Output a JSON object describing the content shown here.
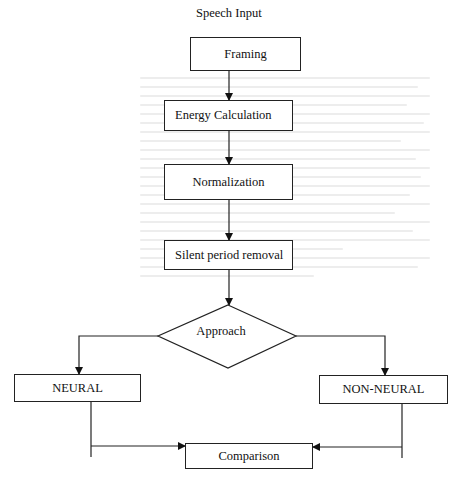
{
  "diagram": {
    "type": "flowchart",
    "input_label": "Speech Input",
    "nodes": [
      {
        "id": "framing",
        "label": "Framing",
        "shape": "rectangle"
      },
      {
        "id": "energy",
        "label": "Energy Calculation",
        "shape": "rectangle"
      },
      {
        "id": "normalization",
        "label": "Normalization",
        "shape": "rectangle"
      },
      {
        "id": "silent",
        "label": "Silent period removal",
        "shape": "rectangle"
      },
      {
        "id": "approach",
        "label": "Approach",
        "shape": "diamond"
      },
      {
        "id": "neural",
        "label": "NEURAL",
        "shape": "rectangle"
      },
      {
        "id": "non_neural",
        "label": "NON-NEURAL",
        "shape": "rectangle"
      },
      {
        "id": "comparison",
        "label": "Comparison",
        "shape": "rectangle"
      }
    ],
    "edges": [
      {
        "from": "framing",
        "to": "energy"
      },
      {
        "from": "energy",
        "to": "normalization"
      },
      {
        "from": "normalization",
        "to": "silent"
      },
      {
        "from": "silent",
        "to": "approach"
      },
      {
        "from": "approach",
        "to": "neural"
      },
      {
        "from": "approach",
        "to": "non_neural"
      },
      {
        "from": "neural",
        "to": "comparison"
      },
      {
        "from": "non_neural",
        "to": "comparison"
      }
    ],
    "colors": {
      "stroke": "#222222",
      "background": "#ffffff"
    }
  }
}
